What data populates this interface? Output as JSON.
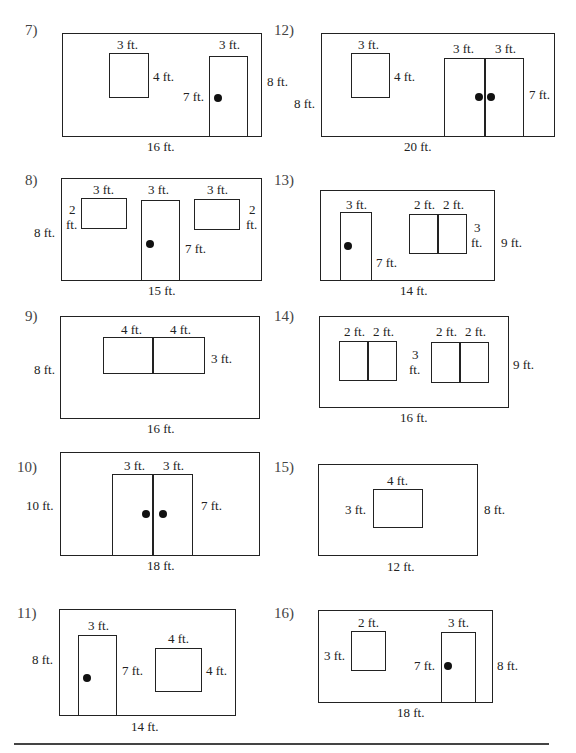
{
  "problems": {
    "p7": {
      "number": "7)",
      "win_w": "3 ft.",
      "win_h": "4 ft.",
      "door_w": "3 ft.",
      "door_h": "7 ft.",
      "wall_h": "8 ft.",
      "wall_w": "16 ft."
    },
    "p12": {
      "number": "12)",
      "win_w": "3 ft.",
      "win_h": "4 ft.",
      "door_w1": "3 ft.",
      "door_w2": "3 ft.",
      "door_h": "7 ft.",
      "wall_h": "8 ft.",
      "wall_w": "20 ft."
    },
    "p8": {
      "number": "8)",
      "win1_w": "3 ft.",
      "win1_h_a": "2",
      "win1_h_b": "ft.",
      "door_w": "3 ft.",
      "door_h": "7 ft.",
      "win2_w": "3 ft.",
      "win2_h_a": "2",
      "win2_h_b": "ft.",
      "wall_h": "8 ft.",
      "wall_w": "15 ft."
    },
    "p13": {
      "number": "13)",
      "door_w": "3 ft.",
      "door_h": "7 ft.",
      "win_w1": "2 ft.",
      "win_w2": "2 ft.",
      "win_h_a": "3",
      "win_h_b": "ft.",
      "wall_h": "9 ft.",
      "wall_w": "14 ft."
    },
    "p9": {
      "number": "9)",
      "win_w1": "4 ft.",
      "win_w2": "4 ft.",
      "win_h": "3 ft.",
      "wall_h": "8 ft.",
      "wall_w": "16 ft."
    },
    "p14": {
      "number": "14)",
      "win1_w1": "2 ft.",
      "win1_w2": "2 ft.",
      "win_h_a": "3",
      "win_h_b": "ft.",
      "win2_w1": "2 ft.",
      "win2_w2": "2 ft.",
      "wall_h": "9 ft.",
      "wall_w": "16 ft."
    },
    "p10": {
      "number": "10)",
      "door_w1": "3 ft.",
      "door_w2": "3 ft.",
      "door_h": "7 ft.",
      "wall_h": "10 ft.",
      "wall_w": "18 ft."
    },
    "p15": {
      "number": "15)",
      "win_w": "4 ft.",
      "win_h": "3 ft.",
      "wall_h": "8 ft.",
      "wall_w": "12 ft."
    },
    "p11": {
      "number": "11)",
      "door_w": "3 ft.",
      "door_h": "7 ft.",
      "win_w": "4 ft.",
      "win_h": "4 ft.",
      "wall_h": "8 ft.",
      "wall_w": "14 ft."
    },
    "p16": {
      "number": "16)",
      "win_w": "2 ft.",
      "win_h": "3 ft.",
      "door_w": "3 ft.",
      "door_h": "7 ft.",
      "wall_h": "8 ft.",
      "wall_w": "18 ft."
    }
  }
}
